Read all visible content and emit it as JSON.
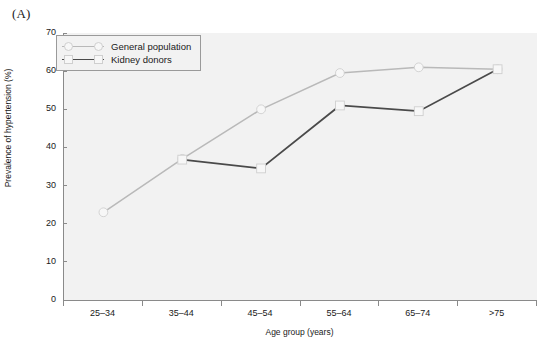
{
  "panel": {
    "letter": "(A)"
  },
  "chart_data": {
    "type": "line",
    "title": "",
    "xlabel": "Age group (years)",
    "ylabel": "Prevalence of hypertension (%)",
    "categories": [
      "25–34",
      "35–44",
      "45–54",
      "55–64",
      "65–74",
      ">75"
    ],
    "ylim": [
      0,
      70
    ],
    "yticks": [
      0,
      10,
      20,
      30,
      40,
      50,
      60,
      70
    ],
    "ytick_labels": [
      "0",
      "10",
      "20",
      "30",
      "40",
      "50",
      "60",
      "70"
    ],
    "grid": false,
    "legend_position": "top-left",
    "series": [
      {
        "name": "General population",
        "color": "#b9b9b9",
        "marker": "circle",
        "values": [
          23,
          37,
          50,
          59.5,
          61,
          60.5
        ]
      },
      {
        "name": "Kidney donors",
        "color": "#4a4a4a",
        "marker": "square",
        "values": [
          null,
          36.8,
          34.5,
          51,
          49.5,
          60.5
        ]
      }
    ]
  },
  "colors": {
    "plot_background": "#f2f2f2",
    "axis": "#8a8a8a",
    "general_population": "#b9b9b9",
    "kidney_donors": "#4a4a4a",
    "text": "#1a1a1a"
  }
}
